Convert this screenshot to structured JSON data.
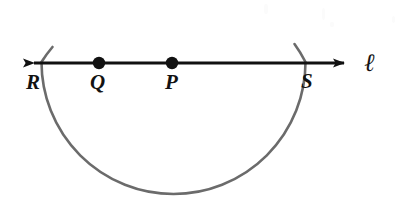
{
  "figure": {
    "background_color": "#ffffff",
    "width": 407,
    "height": 207
  },
  "line": {
    "name": "l",
    "label": "ℓ",
    "label_x": 364,
    "label_y": 50,
    "y": 63,
    "x_start": 22,
    "x_end": 356,
    "color": "#111111",
    "stroke_width": 3,
    "arrowheads": "both"
  },
  "arc": {
    "color": "#6b6b6b",
    "stroke_width": 2.6,
    "center_x": 173.5,
    "center_y": 62,
    "radius": 132,
    "bottom_y": 194,
    "overshoot_top_y": 44,
    "description": "major arc below the line from R to S"
  },
  "points": [
    {
      "id": "R",
      "label": "R",
      "x": 52,
      "y": 63,
      "dot": false,
      "label_x": 26,
      "label_y": 72
    },
    {
      "id": "Q",
      "label": "Q",
      "x": 99,
      "y": 63,
      "dot": true,
      "dot_radius": 6,
      "label_x": 90,
      "label_y": 72
    },
    {
      "id": "P",
      "label": "P",
      "x": 172,
      "y": 63,
      "dot": true,
      "dot_radius": 6,
      "label_x": 165,
      "label_y": 72
    },
    {
      "id": "S",
      "label": "S",
      "x": 295,
      "y": 63,
      "dot": false,
      "label_x": 301,
      "label_y": 71
    }
  ],
  "colors": {
    "ink": "#111111",
    "arc_gray": "#6b6b6b",
    "paper": "#ffffff"
  }
}
